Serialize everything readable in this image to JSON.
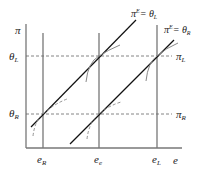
{
  "diagram": {
    "y_axis_label": "π",
    "x_axis_label": "e",
    "x_ticks": [
      {
        "label": "e",
        "sub": "R"
      },
      {
        "label": "e",
        "sub": "e"
      },
      {
        "label": "e",
        "sub": "L"
      }
    ],
    "y_ticks": [
      {
        "label": "θ",
        "sub": "L"
      },
      {
        "label": "θ",
        "sub": "R"
      }
    ],
    "right_labels": [
      {
        "label": "π",
        "sub": "L"
      },
      {
        "label": "π",
        "sub": "R"
      }
    ],
    "lines": [
      {
        "label": "π",
        "sup": "E",
        "rhs": "= θ",
        "rhs_sub": "L"
      },
      {
        "label": "π",
        "sup": "E",
        "rhs": "= θ",
        "rhs_sub": "R"
      }
    ],
    "colors": {
      "axes": "#777777",
      "lines": "#111111",
      "dashed": "#666666",
      "curves": "#888888"
    }
  }
}
